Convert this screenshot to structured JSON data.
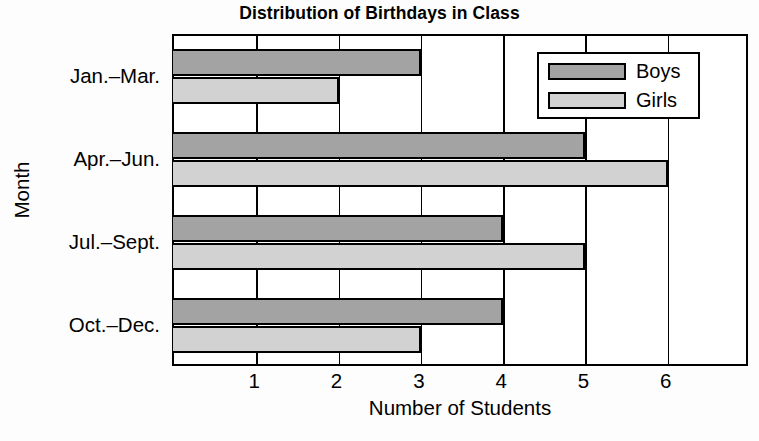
{
  "chart_data": {
    "type": "bar",
    "orientation": "horizontal",
    "title": "Distribution of Birthdays in Class",
    "xlabel": "Number of Students",
    "ylabel": "Month",
    "categories": [
      "Jan.–Mar.",
      "Apr.–Jun.",
      "Jul.–Sept.",
      "Oct.–Dec."
    ],
    "series": [
      {
        "name": "Boys",
        "values": [
          3,
          5,
          4,
          4
        ],
        "color": "#a3a3a3"
      },
      {
        "name": "Girls",
        "values": [
          2,
          6,
          5,
          3
        ],
        "color": "#d2d2d2"
      }
    ],
    "xlim": [
      0,
      7
    ],
    "xticks": [
      1,
      2,
      3,
      4,
      5,
      6
    ],
    "xtick_labels": [
      "1",
      "2",
      "3",
      "4",
      "5",
      "6"
    ],
    "grid": true,
    "grid_axis": "x",
    "legend_position": "top-right-inside",
    "bar_edge_color": "#000000",
    "background": "#ffffff"
  },
  "legend": {
    "entries": [
      {
        "label": "Boys",
        "swatch": "boys-swatch"
      },
      {
        "label": "Girls",
        "swatch": "girls-swatch"
      }
    ]
  }
}
